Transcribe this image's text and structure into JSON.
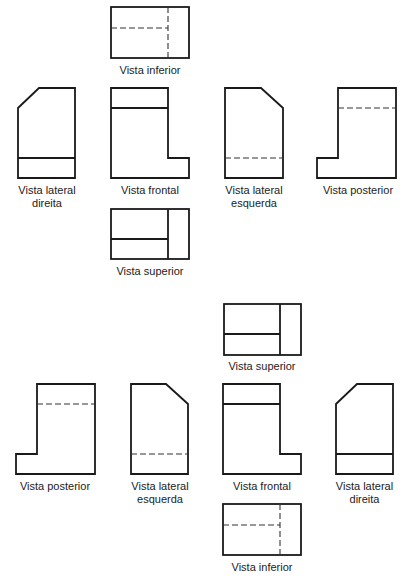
{
  "diagram": {
    "colors": {
      "line": "#1a1a1a",
      "dashed": "#333333",
      "text": "#222222",
      "background": "#ffffff"
    },
    "top_layout": {
      "views": [
        {
          "id": "inferior",
          "label": "Vista inferior"
        },
        {
          "id": "lateral-direita",
          "label_line1": "Vista lateral",
          "label_line2": "direita"
        },
        {
          "id": "frontal",
          "label": "Vista frontal"
        },
        {
          "id": "lateral-esquerda",
          "label_line1": "Vista lateral",
          "label_line2": "esquerda"
        },
        {
          "id": "posterior",
          "label": "Vista posterior"
        },
        {
          "id": "superior",
          "label": "Vista superior"
        }
      ]
    },
    "bottom_layout": {
      "views": [
        {
          "id": "superior",
          "label": "Vista superior"
        },
        {
          "id": "posterior",
          "label": "Vista posterior"
        },
        {
          "id": "lateral-esquerda",
          "label_line1": "Vista lateral",
          "label_line2": "esquerda"
        },
        {
          "id": "frontal",
          "label": "Vista frontal"
        },
        {
          "id": "lateral-direita",
          "label_line1": "Vista lateral",
          "label_line2": "direita"
        },
        {
          "id": "inferior",
          "label": "Vista inferior"
        }
      ]
    }
  }
}
